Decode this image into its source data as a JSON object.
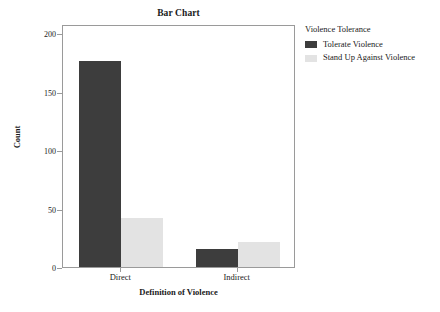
{
  "chart_data": {
    "type": "bar",
    "title": "Bar Chart",
    "xlabel": "Definition of Violence",
    "ylabel": "Count",
    "categories": [
      "Direct",
      "Indirect"
    ],
    "series": [
      {
        "name": "Tolerate Violence",
        "values": [
          176,
          15
        ],
        "color": "#3d3d3d"
      },
      {
        "name": "Stand Up Against Violence",
        "values": [
          42,
          21
        ],
        "color": "#e3e3e3"
      }
    ],
    "legend_title": "Violence Tolerance",
    "legend_position": "right",
    "ylim": [
      0,
      208
    ],
    "yticks": [
      0,
      50,
      100,
      150,
      200
    ],
    "ytick_labels": [
      "0",
      "50",
      "100",
      "150",
      "200"
    ],
    "grid": false,
    "frame": true
  },
  "colors": {
    "series_0": "#3d3d3d",
    "series_1": "#e3e3e3",
    "axis": "#9a9a9a",
    "text": "#1a1a1a",
    "background": "#ffffff"
  }
}
